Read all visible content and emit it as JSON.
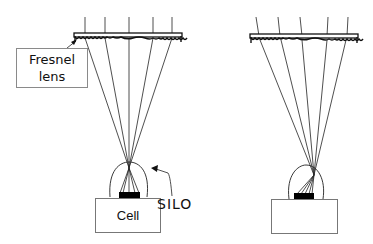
{
  "diagram": {
    "left_panel": {
      "lens_label_line1": "Fresnel",
      "lens_label_line2": "lens",
      "cell_label": "Cell",
      "silo_label": "SILO"
    },
    "right_panel": {
      "cell_label": ""
    }
  },
  "colors": {
    "line": "#1a1a1a",
    "box_border": "#808080",
    "absorber": "#000000",
    "background": "#ffffff"
  }
}
